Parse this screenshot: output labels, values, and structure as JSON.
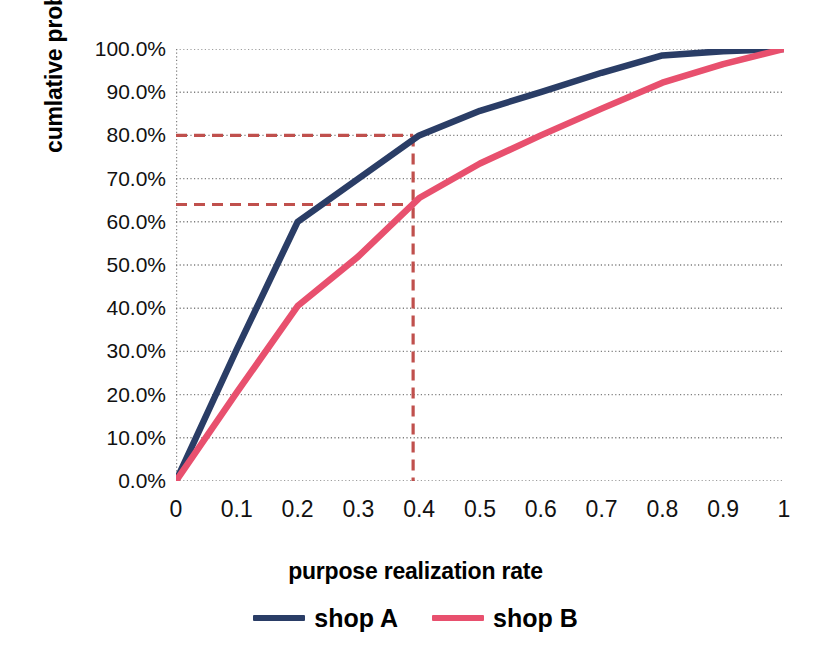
{
  "chart_data": {
    "type": "line",
    "title": "",
    "xlabel": "purpose realization rate",
    "ylabel": "cumlative probability",
    "xlim": [
      0,
      1
    ],
    "ylim": [
      0,
      1
    ],
    "grid": true,
    "legend_position": "bottom",
    "x_tick_labels": [
      "0",
      "0.1",
      "0.2",
      "0.3",
      "0.4",
      "0.5",
      "0.6",
      "0.7",
      "0.8",
      "0.9",
      "1"
    ],
    "x_tick_values": [
      0,
      0.1,
      0.2,
      0.3,
      0.4,
      0.5,
      0.6,
      0.7,
      0.8,
      0.9,
      1
    ],
    "y_tick_labels": [
      "0.0%",
      "10.0%",
      "20.0%",
      "30.0%",
      "40.0%",
      "50.0%",
      "60.0%",
      "70.0%",
      "80.0%",
      "90.0%",
      "100.0%"
    ],
    "y_tick_values": [
      0,
      0.1,
      0.2,
      0.3,
      0.4,
      0.5,
      0.6,
      0.7,
      0.8,
      0.9,
      1.0
    ],
    "x": [
      0,
      0.1,
      0.2,
      0.3,
      0.4,
      0.5,
      0.6,
      0.7,
      0.8,
      0.9,
      1
    ],
    "series": [
      {
        "name": "shop A",
        "color": "#2A3D66",
        "values": [
          0.0,
          0.305,
          0.6,
          0.7,
          0.8,
          0.857,
          0.9,
          0.945,
          0.985,
          0.995,
          1.0
        ]
      },
      {
        "name": "shop B",
        "color": "#E8506E",
        "values": [
          0.0,
          0.205,
          0.405,
          0.52,
          0.655,
          0.735,
          0.8,
          0.862,
          0.922,
          0.965,
          1.0
        ]
      }
    ],
    "annotations": [
      {
        "name": "shop-a-80-percent-guide",
        "type": "hline",
        "y": 0.8,
        "label": "80.0%",
        "color": "#C0504D",
        "style": "dashed"
      },
      {
        "name": "shop-b-64-percent-guide",
        "type": "hline",
        "y": 0.64,
        "label": "64.0%",
        "color": "#C0504D",
        "style": "dashed"
      },
      {
        "name": "realization-rate-guide",
        "type": "vline",
        "x": 0.39,
        "label": "0.39",
        "color": "#C0504D",
        "style": "dashed"
      }
    ]
  },
  "legend": {
    "items": [
      {
        "label": "shop A",
        "color": "#2A3D66"
      },
      {
        "label": "shop B",
        "color": "#E8506E"
      }
    ]
  },
  "axes": {
    "x_title": "purpose realization rate",
    "y_title": "cumlative probability"
  },
  "colors": {
    "shop_a": "#2A3D66",
    "shop_b": "#E8506E",
    "annotation": "#C0504D",
    "gridline": "#7F7F7F",
    "background": "#FFFFFF"
  }
}
